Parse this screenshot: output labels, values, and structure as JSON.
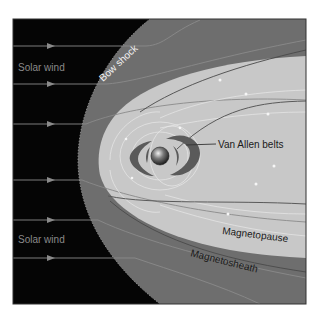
{
  "diagram": {
    "labels": {
      "solar_wind_top": "Solar wind",
      "solar_wind_bottom": "Solar wind",
      "bow_shock": "Bow shock",
      "van_allen": "Van Allen belts",
      "magnetopause": "Magnetopause",
      "magnetosheath": "Magnetosheath"
    },
    "colors": {
      "space": "#050505",
      "magnetosheath": "#6e6e6e",
      "magnetosphere": "#c8c8c8",
      "belts": "#5a5a5a",
      "field_lines": "#e6e6e6",
      "solar_wind_arrows": "#8a8a8a",
      "label_dark": "#1a1a1a",
      "label_light": "#9a9a9a",
      "label_white": "#f2f2f2"
    },
    "icons": {
      "earth": "earth-globe-icon",
      "arrow": "arrow-right-icon"
    }
  }
}
